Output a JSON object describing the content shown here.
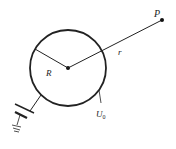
{
  "diagram": {
    "type": "physics-electrostatics",
    "labels": {
      "point": "P",
      "distance": "r",
      "radius": "R",
      "potential_main": "U",
      "potential_sub": "0"
    },
    "colors": {
      "stroke": "#222222",
      "background": "#ffffff"
    }
  }
}
